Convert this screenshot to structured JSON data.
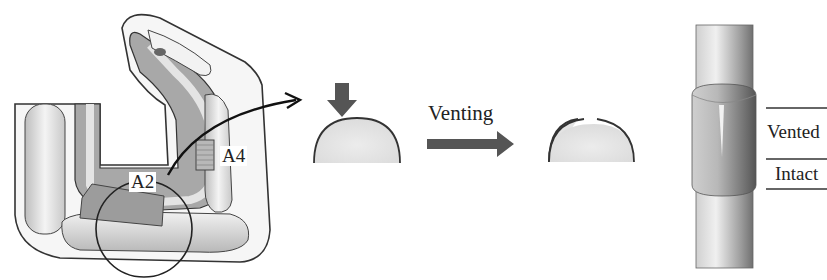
{
  "diagram": {
    "panels": [
      {
        "id": "finger-anatomy",
        "description": "Flexor tendon sheath of finger with pulleys",
        "labels": {
          "a2": "A2",
          "a4": "A4"
        }
      },
      {
        "id": "venting-process",
        "labels": {
          "venting": "Venting"
        }
      },
      {
        "id": "tendon-pulley-detail",
        "labels": {
          "vented": "Vented",
          "intact": "Intact"
        }
      }
    ],
    "colors": {
      "outline": "#3a3a3a",
      "arrow_fill": "#555555",
      "dome_fill": "#e3e3e3",
      "sheath_gray": "#9a9a9a",
      "bone_light": "#eeeeee"
    }
  }
}
